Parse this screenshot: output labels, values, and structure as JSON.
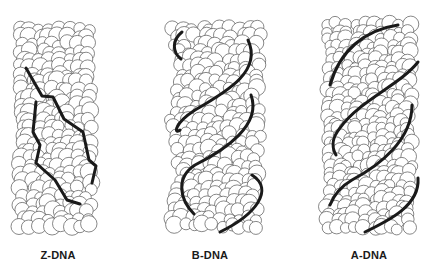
{
  "figure": {
    "background": "#ffffff",
    "atom_stroke": "#555555",
    "atom_fill": "#ffffff",
    "backbone_color": "#1a1a1a",
    "models": [
      {
        "id": "z-dna",
        "label": "Z-DNA",
        "label_x": 18,
        "body": {
          "x": 15,
          "y": 22,
          "w": 88,
          "h": 213,
          "r": 7,
          "seed": 11,
          "waist": 0.0
        },
        "strands": [
          "M26,68 L42,96 L53,97 L64,119 L83,132 L89,160 L96,166 L92,183",
          "M36,102 L33,132 L40,145 L36,163 L55,180 L67,200 L80,204"
        ]
      },
      {
        "id": "b-dna",
        "label": "B-DNA",
        "label_x": 170,
        "body": {
          "x": 165,
          "y": 22,
          "w": 107,
          "h": 218,
          "r": 7,
          "seed": 23,
          "waist": 0.18
        },
        "strands": [
          "M182,32 C172,40 172,52 181,59",
          "M248,40 C262,70 230,90 195,110 C172,125 175,135 180,130",
          "M251,95 C262,125 225,150 195,165 C175,178 180,200 194,214",
          "M252,175 C275,190 255,215 220,232"
        ]
      },
      {
        "id": "a-dna",
        "label": "A-DNA",
        "label_x": 329,
        "body": {
          "x": 322,
          "y": 18,
          "w": 98,
          "h": 222,
          "r": 6.5,
          "seed": 37,
          "waist": 0.05
        },
        "strands": [
          "M398,25 C365,30 340,50 330,85",
          "M418,62 C400,85 360,100 340,128 C330,140 333,150 336,155",
          "M412,105 C412,140 380,165 352,180 C338,188 332,200 330,205",
          "M418,178 C420,205 390,220 365,232"
        ]
      }
    ]
  }
}
